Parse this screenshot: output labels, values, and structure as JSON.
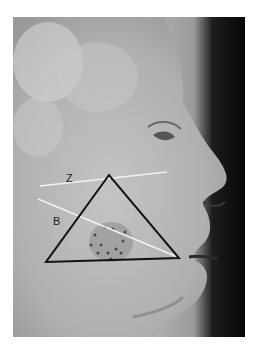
{
  "figure": {
    "labels": {
      "z": "Z",
      "b": "B"
    },
    "colors": {
      "triangle": "#111111",
      "guide_lines": "#f2f2f2",
      "background": "#ffffff"
    }
  }
}
